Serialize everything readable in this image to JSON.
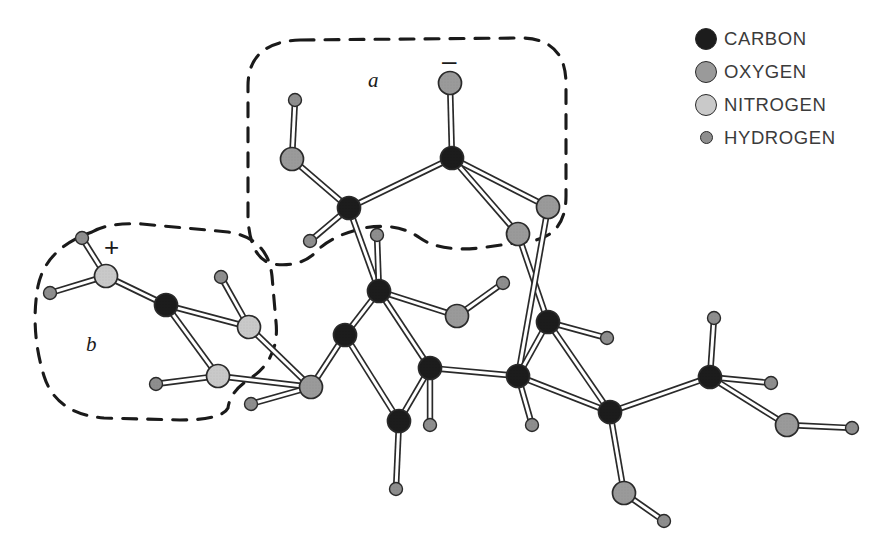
{
  "figure": {
    "width": 880,
    "height": 554,
    "background": "#ffffff"
  },
  "legend": {
    "position": "top-right",
    "items": [
      {
        "label": "CARBON",
        "icon": "carbon-atom-swatch",
        "color": "#1c1c1c",
        "radius": 11
      },
      {
        "label": "OXYGEN",
        "icon": "oxygen-atom-swatch",
        "color": "#9a9a9a",
        "radius": 11
      },
      {
        "label": "NITROGEN",
        "icon": "nitrogen-atom-swatch",
        "color": "#c9c9c9",
        "radius": 11
      },
      {
        "label": "HYDROGEN",
        "icon": "hydrogen-atom-swatch",
        "color": "#8e8e8e",
        "radius": 6.5
      }
    ]
  },
  "annotations": {
    "region_a": {
      "label": "a",
      "x": 368,
      "y": 68
    },
    "region_b": {
      "label": "b",
      "x": 86,
      "y": 332
    },
    "charge_minus": {
      "label": "–",
      "x": 442,
      "y": 48
    },
    "charge_plus": {
      "label": "+",
      "x": 104,
      "y": 234
    }
  },
  "colors": {
    "carbon": "#1c1c1c",
    "oxygen": "#9a9a9a",
    "nitrogen": "#c9c9c9",
    "hydrogen": "#8e8e8e",
    "bond_fill": "#ffffff",
    "bond_stroke": "#2a2a2a",
    "outline": "#1a1a1a",
    "dashed_region": "#1a1a1a"
  },
  "chart_data": {
    "type": "diagram",
    "atoms": [
      {
        "id": "a_h1",
        "element": "H",
        "x": 295,
        "y": 100
      },
      {
        "id": "a_o1",
        "element": "O",
        "x": 292,
        "y": 159
      },
      {
        "id": "a_c1",
        "element": "C",
        "x": 349,
        "y": 208
      },
      {
        "id": "a_h2",
        "element": "H",
        "x": 310,
        "y": 241
      },
      {
        "id": "a_o2",
        "element": "O",
        "x": 450,
        "y": 83
      },
      {
        "id": "a_c2",
        "element": "C",
        "x": 452,
        "y": 158
      },
      {
        "id": "a_o3",
        "element": "O",
        "x": 548,
        "y": 207
      },
      {
        "id": "a_o4",
        "element": "O",
        "x": 518,
        "y": 234
      },
      {
        "id": "b_h1",
        "element": "H",
        "x": 82,
        "y": 238
      },
      {
        "id": "b_n1",
        "element": "N",
        "x": 106,
        "y": 276
      },
      {
        "id": "b_h2",
        "element": "H",
        "x": 50,
        "y": 293
      },
      {
        "id": "b_c1",
        "element": "C",
        "x": 166,
        "y": 305
      },
      {
        "id": "b_h3",
        "element": "H",
        "x": 221,
        "y": 277
      },
      {
        "id": "b_n2",
        "element": "N",
        "x": 249,
        "y": 327
      },
      {
        "id": "b_n3",
        "element": "N",
        "x": 218,
        "y": 376
      },
      {
        "id": "b_h4",
        "element": "H",
        "x": 156,
        "y": 384
      },
      {
        "id": "m_o1",
        "element": "O",
        "x": 311,
        "y": 387
      },
      {
        "id": "m_h1",
        "element": "H",
        "x": 251,
        "y": 404
      },
      {
        "id": "r_h1",
        "element": "H",
        "x": 377,
        "y": 235
      },
      {
        "id": "r_c1",
        "element": "C",
        "x": 379,
        "y": 291
      },
      {
        "id": "r_c2",
        "element": "C",
        "x": 345,
        "y": 335
      },
      {
        "id": "r_c3",
        "element": "C",
        "x": 430,
        "y": 368
      },
      {
        "id": "r_h2",
        "element": "H",
        "x": 430,
        "y": 425
      },
      {
        "id": "r_c4",
        "element": "C",
        "x": 399,
        "y": 421
      },
      {
        "id": "r_h3",
        "element": "H",
        "x": 396,
        "y": 489
      },
      {
        "id": "r_o1",
        "element": "O",
        "x": 457,
        "y": 316
      },
      {
        "id": "r_h4",
        "element": "H",
        "x": 503,
        "y": 283
      },
      {
        "id": "r_c5",
        "element": "C",
        "x": 548,
        "y": 322
      },
      {
        "id": "r_h5",
        "element": "H",
        "x": 607,
        "y": 338
      },
      {
        "id": "r_c6",
        "element": "C",
        "x": 518,
        "y": 376
      },
      {
        "id": "r_h6",
        "element": "H",
        "x": 532,
        "y": 425
      },
      {
        "id": "r_c7",
        "element": "C",
        "x": 610,
        "y": 412
      },
      {
        "id": "t_c1",
        "element": "C",
        "x": 710,
        "y": 377
      },
      {
        "id": "t_h1",
        "element": "H",
        "x": 714,
        "y": 318
      },
      {
        "id": "t_h2",
        "element": "H",
        "x": 771,
        "y": 383
      },
      {
        "id": "t_o1",
        "element": "O",
        "x": 787,
        "y": 425
      },
      {
        "id": "t_h3",
        "element": "H",
        "x": 852,
        "y": 428
      },
      {
        "id": "t_o2",
        "element": "O",
        "x": 624,
        "y": 493
      },
      {
        "id": "t_h4",
        "element": "H",
        "x": 664,
        "y": 521
      }
    ],
    "bonds": [
      [
        "a_h1",
        "a_o1"
      ],
      [
        "a_o1",
        "a_c1"
      ],
      [
        "a_c1",
        "a_h2"
      ],
      [
        "a_c1",
        "a_c2"
      ],
      [
        "a_c2",
        "a_o2"
      ],
      [
        "a_c2",
        "a_o3"
      ],
      [
        "a_c2",
        "a_o4"
      ],
      [
        "a_c1",
        "r_c1"
      ],
      [
        "b_h1",
        "b_n1"
      ],
      [
        "b_n1",
        "b_h2"
      ],
      [
        "b_n1",
        "b_c1"
      ],
      [
        "b_c1",
        "b_n2"
      ],
      [
        "b_h3",
        "b_n2"
      ],
      [
        "b_c1",
        "b_n3"
      ],
      [
        "b_n3",
        "b_h4"
      ],
      [
        "b_n2",
        "m_o1"
      ],
      [
        "b_n3",
        "m_o1"
      ],
      [
        "m_o1",
        "m_h1"
      ],
      [
        "m_o1",
        "r_c2"
      ],
      [
        "r_h1",
        "r_c1"
      ],
      [
        "r_c1",
        "r_c2"
      ],
      [
        "r_c1",
        "r_c3"
      ],
      [
        "r_c2",
        "r_c4"
      ],
      [
        "r_c3",
        "r_c4"
      ],
      [
        "r_c3",
        "r_h2"
      ],
      [
        "r_c4",
        "r_h3"
      ],
      [
        "r_c1",
        "r_o1"
      ],
      [
        "r_o1",
        "r_h4"
      ],
      [
        "a_o4",
        "r_c5"
      ],
      [
        "a_o3",
        "r_c6"
      ],
      [
        "r_c5",
        "r_c6"
      ],
      [
        "r_c5",
        "r_h5"
      ],
      [
        "r_c5",
        "r_c7"
      ],
      [
        "r_c6",
        "r_h6"
      ],
      [
        "r_c6",
        "r_c7"
      ],
      [
        "r_c3",
        "r_c6"
      ],
      [
        "r_c7",
        "t_c1"
      ],
      [
        "r_c7",
        "t_o2"
      ],
      [
        "t_o2",
        "t_h4"
      ],
      [
        "t_c1",
        "t_h1"
      ],
      [
        "t_c1",
        "t_h2"
      ],
      [
        "t_c1",
        "t_o1"
      ],
      [
        "t_o1",
        "t_h3"
      ]
    ],
    "regions": [
      {
        "id": "region-a",
        "label": "a",
        "style": "dashed-rounded"
      },
      {
        "id": "region-b",
        "label": "b",
        "style": "dashed-rounded"
      }
    ]
  }
}
